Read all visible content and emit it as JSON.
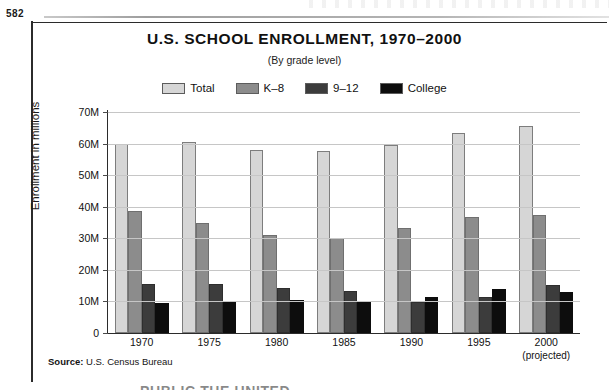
{
  "page": {
    "page_number": "582"
  },
  "figure": {
    "title": "U.S. SCHOOL ENROLLMENT, 1970–2000",
    "subtitle": "(By grade level)",
    "source_label": "Source:",
    "source_text": "U.S. Census Bureau",
    "clipped_caption": "PUBLIC THE UNITED"
  },
  "colors": {
    "total": "#d6d6d6",
    "k8": "#8c8c8c",
    "hs": "#3c3c3c",
    "college": "#0d0d0d",
    "grid": "#c6c6c6",
    "axis": "#2b2b2b"
  },
  "chart_data": {
    "type": "bar",
    "title": "U.S. SCHOOL ENROLLMENT, 1970–2000",
    "subtitle": "(By grade level)",
    "xlabel": "",
    "ylabel": "Enrollment in millions",
    "ylim": [
      0,
      70
    ],
    "ytick_labels": [
      "70M",
      "60M",
      "50M",
      "40M",
      "30M",
      "20M",
      "10M",
      "0"
    ],
    "ytick_values": [
      70,
      60,
      50,
      40,
      30,
      20,
      10,
      0
    ],
    "grid": true,
    "legend_position": "top-center",
    "units": "millions",
    "categories": [
      "1970",
      "1975",
      "1980",
      "1985",
      "1990",
      "1995",
      "2000"
    ],
    "category_notes": [
      "",
      "",
      "",
      "",
      "",
      "",
      "(projected)"
    ],
    "series": [
      {
        "name": "Total",
        "color": "#d6d6d6",
        "values": [
          60.0,
          60.4,
          58.1,
          57.6,
          59.4,
          63.5,
          65.5
        ]
      },
      {
        "name": "K–8",
        "color": "#8c8c8c",
        "values": [
          38.8,
          34.8,
          31.0,
          30.1,
          33.4,
          36.8,
          37.3
        ]
      },
      {
        "name": "9–12",
        "color": "#3c3c3c",
        "values": [
          15.5,
          15.5,
          14.1,
          13.4,
          9.8,
          11.3,
          15.1
        ]
      },
      {
        "name": "College",
        "color": "#0d0d0d",
        "values": [
          9.6,
          10.2,
          10.5,
          10.2,
          11.3,
          14.0,
          13.1
        ]
      }
    ]
  }
}
